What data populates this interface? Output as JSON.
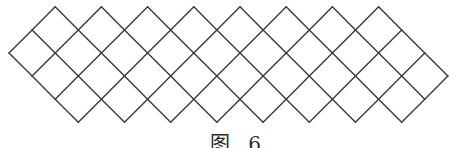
{
  "figure": {
    "type": "diamond-lattice",
    "stroke_color": "#3a3a3a",
    "stroke_width": 1.4,
    "origin": [
      9,
      53
    ],
    "cell_size": 23.1,
    "a_range": [
      0,
      9
    ],
    "b_range": [
      0,
      8
    ],
    "a_minus_b_range": [
      -1,
      2
    ],
    "top_peaks": 8,
    "bottom_vertices": 8
  },
  "caption": {
    "text": "图 6"
  }
}
